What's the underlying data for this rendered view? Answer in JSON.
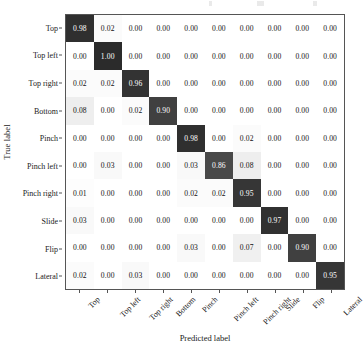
{
  "chart_data": {
    "type": "heatmap",
    "title": "",
    "xlabel": "Predicted label",
    "ylabel": "True label",
    "categories": [
      "Top",
      "Top left",
      "Top right",
      "Bottom",
      "Pinch",
      "Pinch left",
      "Pinch right",
      "Slide",
      "Flip",
      "Lateral"
    ],
    "x_tick_labels": [
      "Top",
      "Top left",
      "Top right",
      "Bottom",
      "Pinch",
      "Pinch left",
      "Pinch right",
      "Slide",
      "Flip",
      "Lateral"
    ],
    "y_tick_labels": [
      "Top",
      "Top left",
      "Top right",
      "Bottom",
      "Pinch",
      "Pinch left",
      "Pinch right",
      "Slide",
      "Flip",
      "Lateral"
    ],
    "x_tick_rotation_deg": -45,
    "colormap": "greys",
    "value_range": [
      0.0,
      1.0
    ],
    "grid": false,
    "legend": "none",
    "colorbar": false,
    "cell_text_format": "0.00",
    "matrix": [
      [
        "0.98",
        "0.02",
        "0.00",
        "0.00",
        "0.00",
        "0.00",
        "0.00",
        "0.00",
        "0.00",
        "0.00"
      ],
      [
        "0.00",
        "1.00",
        "0.00",
        "0.00",
        "0.00",
        "0.00",
        "0.00",
        "0.00",
        "0.00",
        "0.00"
      ],
      [
        "0.02",
        "0.02",
        "0.96",
        "0.00",
        "0.00",
        "0.00",
        "0.00",
        "0.00",
        "0.00",
        "0.00"
      ],
      [
        "0.08",
        "0.00",
        "0.02",
        "0.90",
        "0.00",
        "0.00",
        "0.00",
        "0.00",
        "0.00",
        "0.00"
      ],
      [
        "0.00",
        "0.00",
        "0.00",
        "0.00",
        "0.98",
        "0.00",
        "0.02",
        "0.00",
        "0.00",
        "0.00"
      ],
      [
        "0.00",
        "0.03",
        "0.00",
        "0.00",
        "0.03",
        "0.86",
        "0.08",
        "0.00",
        "0.00",
        "0.00"
      ],
      [
        "0.01",
        "0.00",
        "0.00",
        "0.00",
        "0.02",
        "0.02",
        "0.95",
        "0.00",
        "0.00",
        "0.00"
      ],
      [
        "0.03",
        "0.00",
        "0.00",
        "0.00",
        "0.00",
        "0.00",
        "0.00",
        "0.97",
        "0.00",
        "0.00"
      ],
      [
        "0.00",
        "0.00",
        "0.00",
        "0.00",
        "0.03",
        "0.00",
        "0.07",
        "0.00",
        "0.90",
        "0.00"
      ],
      [
        "0.02",
        "0.00",
        "0.03",
        "0.00",
        "0.00",
        "0.00",
        "0.00",
        "0.00",
        "0.00",
        "0.95"
      ]
    ],
    "values": [
      [
        0.98,
        0.02,
        0.0,
        0.0,
        0.0,
        0.0,
        0.0,
        0.0,
        0.0,
        0.0
      ],
      [
        0.0,
        1.0,
        0.0,
        0.0,
        0.0,
        0.0,
        0.0,
        0.0,
        0.0,
        0.0
      ],
      [
        0.02,
        0.02,
        0.96,
        0.0,
        0.0,
        0.0,
        0.0,
        0.0,
        0.0,
        0.0
      ],
      [
        0.08,
        0.0,
        0.02,
        0.9,
        0.0,
        0.0,
        0.0,
        0.0,
        0.0,
        0.0
      ],
      [
        0.0,
        0.0,
        0.0,
        0.0,
        0.98,
        0.0,
        0.02,
        0.0,
        0.0,
        0.0
      ],
      [
        0.0,
        0.03,
        0.0,
        0.0,
        0.03,
        0.86,
        0.08,
        0.0,
        0.0,
        0.0
      ],
      [
        0.01,
        0.0,
        0.0,
        0.0,
        0.02,
        0.02,
        0.95,
        0.0,
        0.0,
        0.0
      ],
      [
        0.03,
        0.0,
        0.0,
        0.0,
        0.0,
        0.0,
        0.0,
        0.97,
        0.0,
        0.0
      ],
      [
        0.0,
        0.0,
        0.0,
        0.0,
        0.03,
        0.0,
        0.07,
        0.0,
        0.9,
        0.0
      ],
      [
        0.02,
        0.0,
        0.03,
        0.0,
        0.0,
        0.0,
        0.0,
        0.0,
        0.0,
        0.95
      ]
    ],
    "colors": {
      "high": "#2b2b2b",
      "low": "#ffffff",
      "text_on_dark": "#ffffff",
      "text_on_light": "#111111",
      "axis": "#555555"
    }
  }
}
